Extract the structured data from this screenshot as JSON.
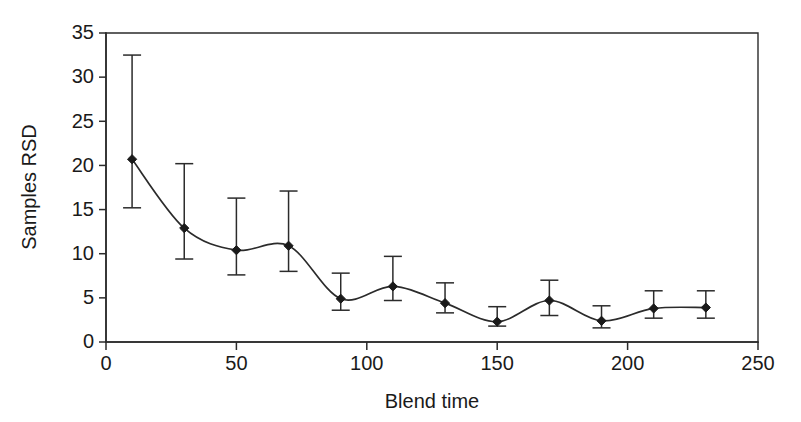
{
  "chart_data": {
    "type": "line",
    "title": "",
    "subtitle": "",
    "xlabel": "Blend time",
    "ylabel": "Samples RSD",
    "xlim": [
      0,
      250
    ],
    "ylim": [
      0,
      35
    ],
    "xticks": [
      "0",
      "50",
      "100",
      "150",
      "200",
      "250"
    ],
    "xtick_values": [
      0,
      50,
      100,
      150,
      200,
      250
    ],
    "yticks": [
      "0",
      "5",
      "10",
      "15",
      "20",
      "25",
      "30",
      "35"
    ],
    "ytick_values": [
      0,
      5,
      10,
      15,
      20,
      25,
      30,
      35
    ],
    "grid": false,
    "legend": null,
    "marker": "filled-diamond",
    "errorbars": true,
    "x": [
      10,
      30,
      50,
      70,
      90,
      110,
      130,
      150,
      170,
      190,
      210,
      230
    ],
    "values": [
      20.7,
      12.9,
      10.4,
      10.9,
      4.9,
      6.3,
      4.4,
      2.3,
      4.7,
      2.4,
      3.8,
      3.9
    ],
    "err_upper": [
      32.5,
      20.2,
      16.3,
      17.1,
      7.8,
      9.7,
      6.7,
      4.0,
      7.0,
      4.1,
      5.8,
      5.8
    ],
    "err_lower": [
      15.2,
      9.4,
      7.6,
      8.0,
      3.6,
      4.7,
      3.3,
      1.8,
      3.0,
      1.6,
      2.7,
      2.7
    ],
    "series": [
      {
        "name": "Samples RSD",
        "values": [
          20.7,
          12.9,
          10.4,
          10.9,
          4.9,
          6.3,
          4.4,
          2.3,
          4.7,
          2.4,
          3.8,
          3.9
        ]
      }
    ],
    "line_color": "#2b2b2b",
    "marker_color": "#1a1a1a",
    "background_color": "#ffffff"
  }
}
